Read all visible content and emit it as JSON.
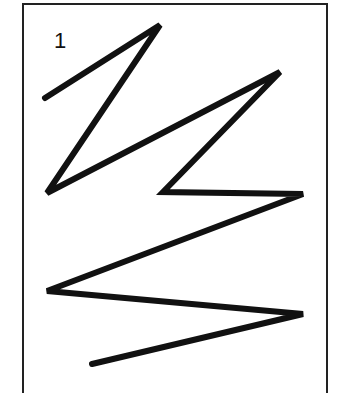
{
  "figure": {
    "label": "1",
    "stroke_color": "#111111",
    "stroke_width": 6,
    "polyline_points": [
      [
        45,
        98
      ],
      [
        160,
        25
      ],
      [
        47,
        193
      ],
      [
        280,
        72
      ],
      [
        163,
        192
      ],
      [
        303,
        194
      ],
      [
        47,
        291
      ],
      [
        303,
        314
      ],
      [
        92,
        364
      ]
    ]
  }
}
